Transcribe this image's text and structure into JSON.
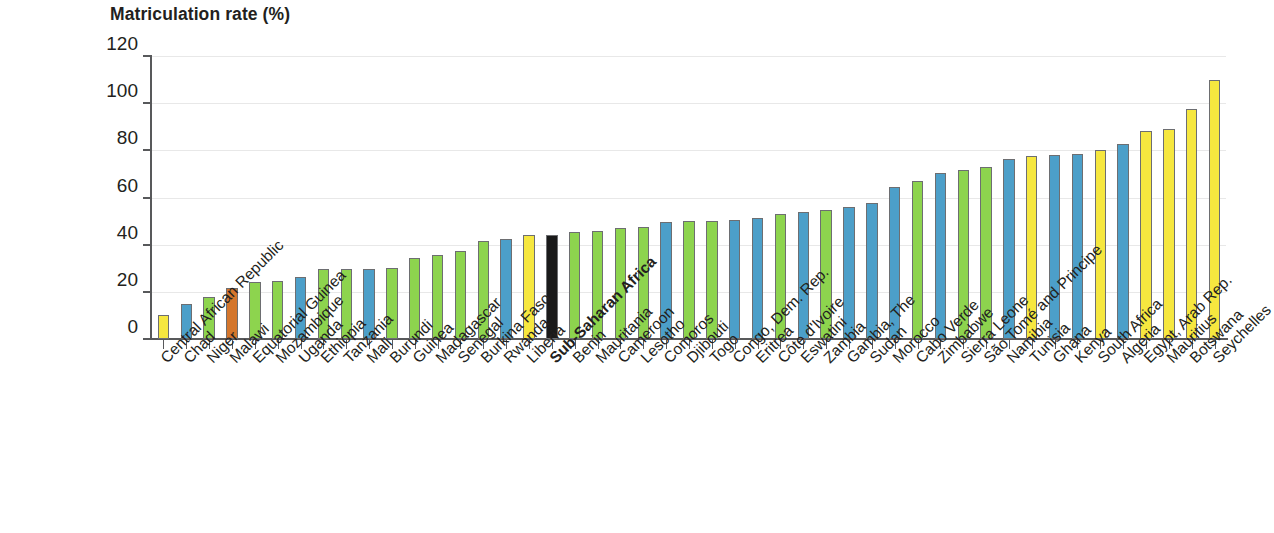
{
  "chart_data": {
    "type": "bar",
    "title": "Matriculation rate (%)",
    "xlabel": "",
    "ylabel": "",
    "ylim": [
      0,
      120
    ],
    "yticks": [
      0,
      20,
      40,
      60,
      80,
      100,
      120
    ],
    "grid": true,
    "legend": "none",
    "categories": [
      "Central African Republic",
      "Chad",
      "Niger",
      "Malawi",
      "Equatorial Guinea",
      "Mozambique",
      "Uganda",
      "Ethiopia",
      "Tanzania",
      "Mali",
      "Burundi",
      "Guinea",
      "Madagascar",
      "Senegal",
      "Burkina Faso",
      "Rwanda",
      "Liberia",
      "Sub-Saharan Africa",
      "Benin",
      "Mauritania",
      "Cameroon",
      "Lesotho",
      "Comoros",
      "Djibouti",
      "Togo",
      "Congo, Dem. Rep.",
      "Eritrea",
      "Côte d'Ivoire",
      "Eswatini",
      "Zambia",
      "Gambia, The",
      "Sudan",
      "Morocco",
      "Cabo Verde",
      "Zimbabwe",
      "Sierra Leone",
      "São Tomé and Principe",
      "Namibia",
      "Tunisia",
      "Ghana",
      "Kenya",
      "South Africa",
      "Algeria",
      "Egypt, Arab Rep.",
      "Mauritius",
      "Botswana",
      "Seychelles"
    ],
    "values": [
      10,
      15,
      18,
      21.5,
      24,
      24.5,
      26.5,
      29.5,
      29.5,
      29.5,
      30,
      34.5,
      35.5,
      37.5,
      41.5,
      42.5,
      44,
      44,
      45.5,
      46,
      47,
      47.5,
      49.5,
      50,
      50,
      50.5,
      51.5,
      53,
      54,
      54.5,
      56,
      57.5,
      64.5,
      67,
      70.5,
      71.5,
      73,
      76.5,
      77.5,
      78,
      78.5,
      80,
      82.5,
      88,
      89,
      97.5,
      110
    ],
    "bar_colors": [
      "yellow",
      "blue",
      "green",
      "orange",
      "green",
      "green",
      "blue",
      "green",
      "green",
      "blue",
      "green",
      "green",
      "green",
      "green",
      "green",
      "blue",
      "yellow",
      "black",
      "green",
      "green",
      "green",
      "green",
      "blue",
      "green",
      "green",
      "blue",
      "blue",
      "green",
      "blue",
      "green",
      "blue",
      "blue",
      "blue",
      "green",
      "blue",
      "green",
      "green",
      "blue",
      "yellow",
      "blue",
      "blue",
      "yellow",
      "blue",
      "yellow",
      "yellow",
      "yellow",
      "yellow"
    ],
    "highlight_category": "Sub-Saharan Africa"
  },
  "palette": {
    "yellow": "#F6E73F",
    "blue": "#4C9FC9",
    "green": "#8DD44E",
    "orange": "#D4762C",
    "black": "#1A1A1A",
    "bar_stroke": "#6D6E71",
    "axis": "#58595B",
    "grid": "#E8E8E8",
    "text": "#231F20"
  }
}
